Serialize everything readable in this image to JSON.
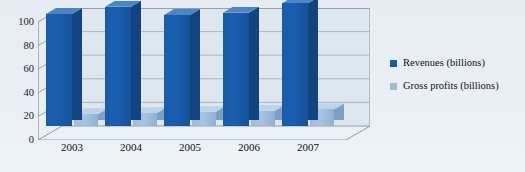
{
  "chart_data": {
    "type": "bar",
    "title": "",
    "subtitle": "",
    "xlabel": "",
    "ylabel": "",
    "categories": [
      "2003",
      "2004",
      "2005",
      "2006",
      "2007"
    ],
    "series": [
      {
        "name": "Revenues (billions)",
        "color": "#1a5cab",
        "values": [
          95,
          101,
          94,
          96,
          104
        ]
      },
      {
        "name": "Gross profits (billions)",
        "color": "#9dbcdd",
        "values": [
          10,
          11,
          12,
          13,
          14
        ]
      }
    ],
    "ylim": [
      0,
      100
    ],
    "yticks": [
      "0",
      "20",
      "40",
      "60",
      "80",
      "100"
    ],
    "ytick_values": [
      0,
      20,
      40,
      60,
      80,
      100
    ],
    "grid": true,
    "legend_position": "right",
    "projection": "3d"
  },
  "legend": {
    "items": [
      {
        "label": "Revenues (billions)",
        "color": "#1a5cab"
      },
      {
        "label": "Gross profits (billions)",
        "color": "#9dbcdd"
      }
    ]
  },
  "axes": {
    "y_tick_labels": [
      "100",
      "80",
      "60",
      "40",
      "20",
      "0"
    ],
    "x_tick_labels": [
      "2003",
      "2004",
      "2005",
      "2006",
      "2007"
    ]
  },
  "colors": {
    "background": "#e9eef3",
    "plot_wall": "#dfe7ee",
    "gridline": "#97a3ae",
    "axis": "#8d99a4",
    "revenue": "#1a5cab",
    "revenue_top": "#4d84c4",
    "revenue_side": "#12457f",
    "gross_profit": "#9dbcdd",
    "gross_profit_top": "#bdd3e9",
    "gross_profit_side": "#7e9fc4"
  }
}
